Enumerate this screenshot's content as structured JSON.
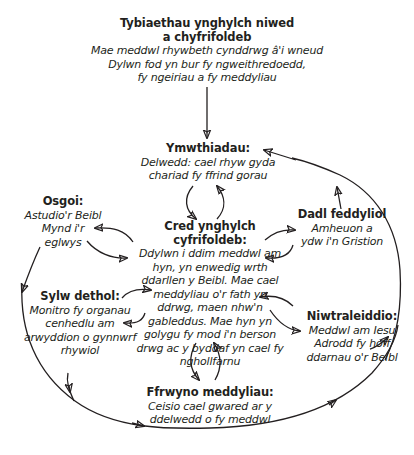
{
  "diagram": {
    "type": "cognitive-cycle",
    "colors": {
      "ink": "#231f20",
      "background": "#ffffff"
    },
    "nodes": {
      "belief_top": {
        "title": "Tybiaethau ynghylch niwed a chyfrifoldeb",
        "title_lines": [
          "Tybiaethau ynghylch niwed",
          "a chyfrifoldeb"
        ],
        "body_lines": [
          "Mae meddwl rhywbeth cynddrwg â'i wneud",
          "Dylwn fod yn bur fy ngweithredoedd,",
          "fy ngeiriau a fy meddyliau"
        ]
      },
      "intrusions": {
        "title": "Ymwthiadau:",
        "body_lines": [
          "Delwedd: cael rhyw gyda",
          "chariad fy ffrind gorau"
        ]
      },
      "responsibility": {
        "title": "Cred ynghylch cyfrifoldeb:",
        "body_lines": [
          "Ddylwn i ddim meddwl am",
          "hyn, yn enwedig wrth",
          "ddarllen y Beibl. Mae cael",
          "meddyliau o'r fath yn",
          "ddrwg, maen nhw'n",
          "gableddus. Mae hyn yn",
          "golygu fy mod i'n berson",
          "drwg ac y byddaf yn cael fy",
          "nghollfarnu"
        ]
      },
      "avoidance": {
        "title": "Osgoi:",
        "body_lines": [
          "Astudio'r Beibl",
          "Mynd i'r",
          "eglwys"
        ]
      },
      "argument": {
        "title": "Dadl feddyliol",
        "body_lines": [
          "Amheuon a",
          "ydw i'n Gristion"
        ]
      },
      "selective_attention": {
        "title": "Sylw dethol:",
        "body_lines": [
          "Monitro fy organau",
          "cenhedlu am",
          "arwyddion o gynnwrf",
          "rhywiol"
        ]
      },
      "neutralising": {
        "title": "Niwtraleiddio:",
        "body_lines": [
          "Meddwl am Iesu",
          "Adrodd fy hoff",
          "ddarnau o'r Beibl"
        ]
      },
      "suppression": {
        "title": "Ffrwyno meddyliau:",
        "body_lines": [
          "Ceisio cael gwared ar y",
          "ddelwedd o fy meddwl"
        ]
      }
    },
    "edges": [
      {
        "from": "belief_top",
        "to": "intrusions",
        "style": "straight-arrow"
      },
      {
        "from": "intrusions",
        "to": "responsibility",
        "style": "curved-arrow"
      },
      {
        "from": "responsibility",
        "to": "intrusions",
        "style": "curved-arrow"
      },
      {
        "from": "responsibility",
        "to": "avoidance",
        "style": "curved-arrow"
      },
      {
        "from": "avoidance",
        "to": "responsibility",
        "style": "curved-arrow"
      },
      {
        "from": "responsibility",
        "to": "argument",
        "style": "curved-arrow"
      },
      {
        "from": "argument",
        "to": "responsibility",
        "style": "curved-arrow"
      },
      {
        "from": "selective_attention",
        "to": "responsibility",
        "style": "curved-arrow"
      },
      {
        "from": "responsibility",
        "to": "selective_attention",
        "style": "curved-arrow"
      },
      {
        "from": "neutralising",
        "to": "responsibility",
        "style": "curved-arrow"
      },
      {
        "from": "responsibility",
        "to": "neutralising",
        "style": "curved-arrow"
      },
      {
        "from": "responsibility",
        "to": "suppression",
        "style": "curved-arrow"
      },
      {
        "from": "suppression",
        "to": "responsibility",
        "style": "curved-arrow"
      },
      {
        "from": "avoidance",
        "to": "outer-loop",
        "style": "arrow-to-loop"
      },
      {
        "from": "sylw-area",
        "to": "outer-loop",
        "style": "arrow-to-loop"
      },
      {
        "from": "argument",
        "to": "outer-loop",
        "style": "arrow-to-loop"
      },
      {
        "from": "neutralising",
        "to": "outer-loop",
        "style": "arrow-to-loop"
      },
      {
        "from": "outer-loop",
        "to": "intrusions",
        "style": "outer-feedback-loop"
      }
    ]
  }
}
